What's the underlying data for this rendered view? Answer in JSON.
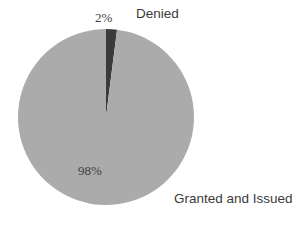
{
  "chart_data": {
    "type": "pie",
    "title": "",
    "subtitle": "",
    "xlabel": "",
    "ylabel": "",
    "legend_position": "none",
    "grid": false,
    "background_color": "#ffffff",
    "center": {
      "x": 106,
      "y": 117
    },
    "radius": 88,
    "start_angle_deg": 0,
    "direction": "clockwise",
    "categories": [
      "Denied",
      "Granted and Issued"
    ],
    "values": [
      2,
      98
    ],
    "value_labels": [
      "2%",
      "98%"
    ],
    "colors": [
      "#3a3a3a",
      "#ababab"
    ],
    "slices": [
      {
        "name": "Denied",
        "value": 2,
        "value_label": "2%",
        "color": "#3a3a3a",
        "start_angle_deg": 0,
        "end_angle_deg": 7.2,
        "label_position": "outside-top"
      },
      {
        "name": "Granted and Issued",
        "value": 98,
        "value_label": "98%",
        "color": "#ababab",
        "start_angle_deg": 7.2,
        "end_angle_deg": 360,
        "label_position": "inside-bottom-left"
      }
    ]
  },
  "labels": {
    "denied_value": "2%",
    "denied_name": "Denied",
    "granted_value": "98%",
    "granted_name": "Granted and Issued"
  }
}
